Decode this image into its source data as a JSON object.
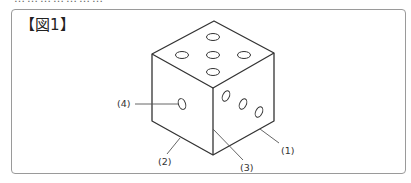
{
  "figure": {
    "label": "【図1】",
    "callouts": [
      {
        "id": "1",
        "text": "(1)",
        "target": "right-bottom-edge"
      },
      {
        "id": "2",
        "text": "(2)",
        "target": "left-bottom-edge"
      },
      {
        "id": "3",
        "text": "(3)",
        "target": "front-vertical-edge"
      },
      {
        "id": "4",
        "text": "(4)",
        "target": "left-face-pip"
      }
    ],
    "faces": {
      "top_pips": 5,
      "left_pips": 1,
      "right_pips": 3
    }
  },
  "colors": {
    "line": "#333333",
    "frame": "#9a9a9a",
    "leader": "#555555"
  }
}
